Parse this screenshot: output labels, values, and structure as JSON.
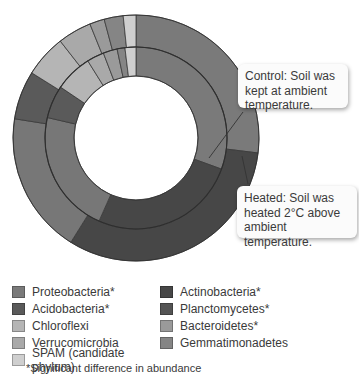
{
  "chart_data": {
    "type": "pie",
    "subtype": "nested-donut",
    "title": "",
    "center": [
      136,
      138
    ],
    "rings": [
      {
        "name": "Control",
        "annotation": "Control: Soil was kept at ambient temperature.",
        "inner_radius": 62,
        "outer_radius": 91,
        "segments": [
          {
            "label": "Proteobacteria*",
            "start_deg": 0,
            "end_deg": 110,
            "color": "#7a7a7a"
          },
          {
            "label": "Actinobacteria*",
            "start_deg": 110,
            "end_deg": 204,
            "color": "#474747"
          },
          {
            "label": "Proteobacteria*",
            "start_deg": 204,
            "end_deg": 283,
            "color": "#777777"
          },
          {
            "label": "Acidobacteria*",
            "start_deg": 283,
            "end_deg": 304,
            "color": "#5a5a5a"
          },
          {
            "label": "Chloroflexi",
            "start_deg": 304,
            "end_deg": 328,
            "color": "#b5b5b5"
          },
          {
            "label": "Verrucomicrobia",
            "start_deg": 328,
            "end_deg": 339,
            "color": "#a9a9a9"
          },
          {
            "label": "Bacteroidetes*",
            "start_deg": 339,
            "end_deg": 348,
            "color": "#9a9a9a"
          },
          {
            "label": "Gemmatimonadetes",
            "start_deg": 348,
            "end_deg": 353,
            "color": "#858585"
          },
          {
            "label": "SPAM (candidate phylum)",
            "start_deg": 353,
            "end_deg": 360,
            "color": "#cfcfcf"
          }
        ]
      },
      {
        "name": "Heated",
        "annotation": "Heated: Soil was heated 2°C above ambient temperature.",
        "inner_radius": 91,
        "outer_radius": 123,
        "segments": [
          {
            "label": "Proteobacteria*",
            "start_deg": 0,
            "end_deg": 97,
            "color": "#7a7a7a"
          },
          {
            "label": "Actinobacteria*",
            "start_deg": 97,
            "end_deg": 212,
            "color": "#474747"
          },
          {
            "label": "Proteobacteria*",
            "start_deg": 212,
            "end_deg": 279,
            "color": "#777777"
          },
          {
            "label": "Acidobacteria*",
            "start_deg": 279,
            "end_deg": 302,
            "color": "#5a5a5a"
          },
          {
            "label": "Chloroflexi",
            "start_deg": 302,
            "end_deg": 322,
            "color": "#b5b5b5"
          },
          {
            "label": "Verrucomicrobia",
            "start_deg": 322,
            "end_deg": 338,
            "color": "#a9a9a9"
          },
          {
            "label": "Bacteroidetes*",
            "start_deg": 338,
            "end_deg": 345,
            "color": "#9a9a9a"
          },
          {
            "label": "Gemmatimonadetes",
            "start_deg": 345,
            "end_deg": 354,
            "color": "#858585"
          },
          {
            "label": "SPAM (candidate phylum)",
            "start_deg": 354,
            "end_deg": 360,
            "color": "#cfcfcf"
          }
        ]
      }
    ],
    "legend": [
      {
        "label": "Proteobacteria*",
        "color": "#7a7a7a"
      },
      {
        "label": "Actinobacteria*",
        "color": "#474747"
      },
      {
        "label": "Acidobacteria*",
        "color": "#5a5a5a"
      },
      {
        "label": "Planctomycetes*",
        "color": "#545454"
      },
      {
        "label": "Chloroflexi",
        "color": "#b5b5b5"
      },
      {
        "label": "Bacteroidetes*",
        "color": "#9a9a9a"
      },
      {
        "label": "Verrucomicrobia",
        "color": "#a9a9a9"
      },
      {
        "label": "Gemmatimonadetes",
        "color": "#858585"
      },
      {
        "label": "SPAM (candidate phylum)",
        "color": "#cfcfcf"
      }
    ],
    "legend_position": "bottom",
    "footnote": "*Significant difference in abundance"
  },
  "callouts": {
    "control": "Control: Soil was kept at ambient temperature.",
    "heated": "Heated: Soil was heated 2°C above ambient temperature."
  },
  "legend": {
    "items": [
      {
        "label": "Proteobacteria*",
        "color": "#7a7a7a"
      },
      {
        "label": "Actinobacteria*",
        "color": "#474747"
      },
      {
        "label": "Acidobacteria*",
        "color": "#5a5a5a"
      },
      {
        "label": "Planctomycetes*",
        "color": "#545454"
      },
      {
        "label": "Chloroflexi",
        "color": "#b5b5b5"
      },
      {
        "label": "Bacteroidetes*",
        "color": "#9a9a9a"
      },
      {
        "label": "Verrucomicrobia",
        "color": "#a9a9a9"
      },
      {
        "label": "Gemmatimonadetes",
        "color": "#858585"
      },
      {
        "label": "SPAM (candidate phylum)",
        "color": "#cfcfcf"
      }
    ],
    "footnote": "*Significant difference in abundance"
  }
}
